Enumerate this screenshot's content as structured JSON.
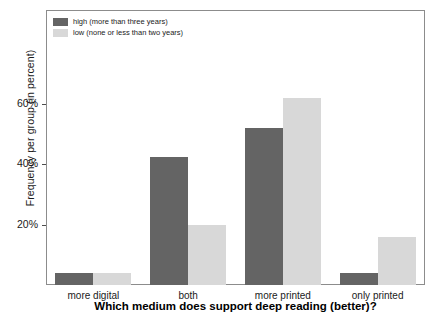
{
  "chart_data": {
    "type": "bar",
    "title": "",
    "xlabel": "Which medium does support deep reading (better)?",
    "ylabel": "Frequency per group (in percent)",
    "categories": [
      "more digital",
      "both",
      "more printed",
      "only printed"
    ],
    "series": [
      {
        "name": "high (more than three years)",
        "color": "#646464",
        "values": [
          4,
          42.5,
          52,
          4
        ]
      },
      {
        "name": "low (none or less than two years)",
        "color": "#d8d8d8",
        "values": [
          4,
          20,
          62,
          16
        ]
      }
    ],
    "ylim": [
      0,
      91
    ],
    "yticks": [
      20,
      40,
      60
    ],
    "ytick_labels": [
      "20%",
      "40%",
      "60%"
    ],
    "grid": false,
    "legend_position": "top-left",
    "frame_color": "#8c8c8c"
  }
}
